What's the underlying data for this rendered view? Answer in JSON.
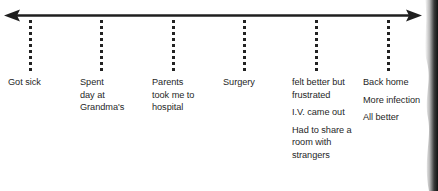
{
  "figure": {
    "background_color": "#ffffff",
    "ink_color": "#1f1f1f"
  },
  "axis": {
    "name": "timeline-axis",
    "orientation": "horizontal",
    "left_arrowhead": true,
    "right_arrowhead": true,
    "line_color": "#1f1f1f",
    "tick_style": "dotted-vertical",
    "tick_count": 6,
    "tick_positions_px": [
      30,
      101,
      173,
      244,
      316,
      388
    ]
  },
  "events": [
    {
      "index": 0,
      "name": "got-sick",
      "paragraphs": [
        {
          "lines": [
            "Got sick"
          ]
        }
      ]
    },
    {
      "index": 1,
      "name": "spent-day-at-grandmas",
      "paragraphs": [
        {
          "lines": [
            "Spent",
            "day at",
            "Grandma's"
          ]
        }
      ]
    },
    {
      "index": 2,
      "name": "parents-took-me-to-hospital",
      "paragraphs": [
        {
          "lines": [
            "Parents",
            "took me to",
            "hospital"
          ]
        }
      ]
    },
    {
      "index": 3,
      "name": "surgery",
      "paragraphs": [
        {
          "lines": [
            "Surgery"
          ]
        }
      ]
    },
    {
      "index": 4,
      "name": "felt-better-but-frustrated",
      "paragraphs": [
        {
          "lines": [
            "felt better but",
            "frustrated"
          ]
        },
        {
          "lines": [
            "I.V. came out"
          ]
        },
        {
          "lines": [
            "Had to share a",
            "room with",
            "strangers"
          ]
        }
      ]
    },
    {
      "index": 5,
      "name": "back-home",
      "paragraphs": [
        {
          "lines": [
            "Back home"
          ]
        },
        {
          "lines": [
            "More infection"
          ]
        },
        {
          "lines": [
            "All better"
          ]
        }
      ]
    }
  ]
}
